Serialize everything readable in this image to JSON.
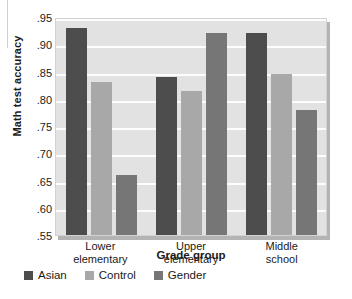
{
  "chart_data": {
    "type": "bar",
    "title": "",
    "xlabel": "Grade group",
    "ylabel": "Math test accuracy",
    "categories": [
      "Lower elementary",
      "Upper elementary",
      "Middle school"
    ],
    "category_lines": [
      [
        "Lower",
        "elementary"
      ],
      [
        "Upper",
        "elementary"
      ],
      [
        "Middle",
        "school"
      ]
    ],
    "series": [
      {
        "name": "Asian",
        "color": "#4d4d4d",
        "values": [
          0.93,
          0.84,
          0.92
        ]
      },
      {
        "name": "Control",
        "color": "#a8a8a8",
        "values": [
          0.83,
          0.815,
          0.845
        ]
      },
      {
        "name": "Gender",
        "color": "#767676",
        "values": [
          0.66,
          0.92,
          0.78
        ]
      }
    ],
    "ylim": [
      0.55,
      0.95
    ],
    "yticks": [
      0.95,
      0.9,
      0.85,
      0.8,
      0.75,
      0.7,
      0.65,
      0.6,
      0.55
    ],
    "ytick_labels": [
      ".95",
      ".90",
      ".85",
      ".80",
      ".75",
      ".70",
      ".65",
      ".60",
      ".55"
    ],
    "grid": true,
    "legend_position": "bottom-left",
    "plot_background": "#e2e2e2",
    "gridline_color": "#fdfdfd"
  }
}
